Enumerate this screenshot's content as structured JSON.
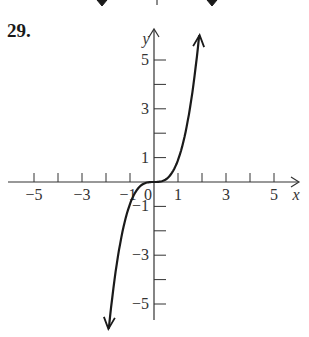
{
  "problem": {
    "number": "29."
  },
  "chart_data": {
    "type": "line",
    "title": "",
    "xlabel": "x",
    "ylabel": "y",
    "xlim": [
      -6,
      6
    ],
    "ylim": [
      -6,
      6
    ],
    "grid": false,
    "legend": null,
    "x_tick_labels": [
      "-5",
      "-3",
      "-1",
      "0",
      "1",
      "3",
      "5"
    ],
    "y_tick_labels": [
      "5",
      "3",
      "1",
      "-1",
      "-3",
      "-5"
    ],
    "x_ticks": [
      -5,
      -4,
      -3,
      -2,
      -1,
      1,
      2,
      3,
      4,
      5
    ],
    "y_ticks": [
      -5,
      -4,
      -3,
      -2,
      -1,
      1,
      2,
      3,
      4,
      5
    ],
    "series": [
      {
        "name": "y = x^3 (approx.)",
        "description": "Cubic-shaped curve, flat near origin, arrows at both ends",
        "x": [
          -1.9,
          -1.7,
          -1.5,
          -1.3,
          -1.1,
          -0.9,
          -0.7,
          -0.5,
          -0.3,
          0,
          0.3,
          0.5,
          0.7,
          0.9,
          1.1,
          1.3,
          1.5,
          1.7,
          1.9
        ],
        "y": [
          -6.0,
          -4.9,
          -3.4,
          -2.2,
          -1.3,
          -0.7,
          -0.3,
          -0.1,
          0,
          0,
          0,
          0.1,
          0.3,
          0.7,
          1.3,
          2.2,
          3.4,
          4.9,
          6.0
        ]
      }
    ],
    "annotations": [],
    "colors": {
      "axis": "#333333",
      "curve": "#1a1a1a",
      "text": "#333333"
    }
  },
  "top_fragment": {
    "description": "partial arrows from previous figure at top edge"
  }
}
